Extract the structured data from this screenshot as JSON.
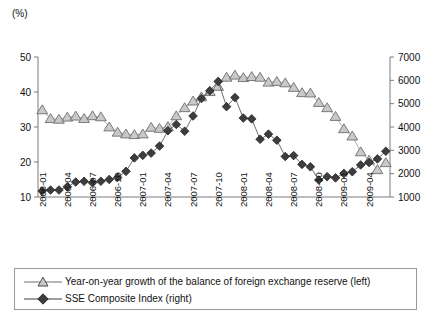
{
  "chart_data": {
    "type": "line",
    "title": "",
    "unit_label": "(%)",
    "xlabel": "",
    "ylabel": "",
    "grid": false,
    "legend_position": "bottom",
    "x": [
      "2006-01",
      "2006-02",
      "2006-03",
      "2006-04",
      "2006-05",
      "2006-06",
      "2006-07",
      "2006-08",
      "2006-09",
      "2006-10",
      "2006-11",
      "2006-12",
      "2007-01",
      "2007-02",
      "2007-03",
      "2007-04",
      "2007-05",
      "2007-06",
      "2007-07",
      "2007-08",
      "2007-09",
      "2007-10",
      "2007-11",
      "2007-12",
      "2008-01",
      "2008-02",
      "2008-03",
      "2008-04",
      "2008-05",
      "2008-06",
      "2008-07",
      "2008-08",
      "2008-09",
      "2008-10",
      "2008-11",
      "2008-12",
      "2009-01",
      "2009-02",
      "2009-03",
      "2009-04",
      "2009-05",
      "2009-06"
    ],
    "x_tick_labels": [
      "2006-01",
      "2006-04",
      "2006-07",
      "2006-10",
      "2007-01",
      "2007-04",
      "2007-07",
      "2007-10",
      "2008-01",
      "2008-04",
      "2008-07",
      "2008-10",
      "2009-01",
      "2009-04"
    ],
    "left_axis": {
      "ticks": [
        10,
        20,
        30,
        40,
        50
      ],
      "ylim": [
        10,
        50
      ],
      "unit": "(%)"
    },
    "right_axis": {
      "ticks": [
        1000,
        2000,
        3000,
        4000,
        5000,
        6000,
        7000
      ],
      "ylim": [
        1000,
        7000
      ]
    },
    "series": [
      {
        "name": "Year-on-year growth of the balance of foreign exchange reserve (left)",
        "axis": "left",
        "marker": "triangle",
        "values": [
          34.9,
          32.4,
          32.2,
          32.8,
          33.1,
          32.4,
          33.2,
          32.9,
          30.0,
          28.5,
          28.0,
          27.8,
          28.0,
          29.9,
          29.6,
          30.1,
          33.2,
          35.5,
          37.4,
          38.6,
          40.1,
          41.6,
          44.2,
          44.8,
          44.1,
          44.4,
          44.2,
          42.8,
          43.0,
          42.6,
          41.3,
          39.8,
          39.7,
          37.0,
          35.5,
          33.0,
          29.5,
          27.4,
          22.9,
          20.5,
          17.8,
          19.8
        ]
      },
      {
        "name": "SSE Composite Index (right)",
        "axis": "right",
        "marker": "diamond",
        "values": [
          1258,
          1298,
          1298,
          1440,
          1641,
          1672,
          1612,
          1673,
          1752,
          1837,
          2099,
          2675,
          2786,
          2881,
          3183,
          3841,
          4110,
          3821,
          4472,
          5219,
          5552,
          5954,
          4872,
          5262,
          4383,
          4348,
          3473,
          3693,
          3433,
          2736,
          2775,
          2397,
          2294,
          1728,
          1871,
          1821,
          2011,
          2083,
          2373,
          2478,
          2632,
          2959
        ]
      }
    ],
    "legend": [
      {
        "label": "Year-on-year growth of the balance of foreign exchange reserve (left)",
        "marker": "triangle"
      },
      {
        "label": "SSE Composite Index (right)",
        "marker": "diamond"
      }
    ]
  }
}
